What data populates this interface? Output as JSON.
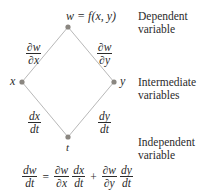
{
  "diagram": {
    "nodes": {
      "w": {
        "label": "w = f(x, y)",
        "role": "dependent"
      },
      "x": {
        "label": "x",
        "role": "intermediate"
      },
      "y": {
        "label": "y",
        "role": "intermediate"
      },
      "t": {
        "label": "t",
        "role": "independent"
      }
    },
    "edges": [
      {
        "from": "w",
        "to": "x",
        "label_num": "∂w",
        "label_den": "∂x"
      },
      {
        "from": "w",
        "to": "y",
        "label_num": "∂w",
        "label_den": "∂y"
      },
      {
        "from": "x",
        "to": "t",
        "label_num": "dx",
        "label_den": "dt"
      },
      {
        "from": "y",
        "to": "t",
        "label_num": "dy",
        "label_den": "dt"
      }
    ],
    "side_labels": {
      "dependent": [
        "Dependent",
        "variable"
      ],
      "intermediate": [
        "Intermediate",
        "variables"
      ],
      "independent": [
        "Independent",
        "variable"
      ]
    },
    "equation": {
      "lhs": {
        "num": "dw",
        "den": "dt"
      },
      "equals": "=",
      "term1": [
        {
          "num": "∂w",
          "den": "∂x"
        },
        {
          "num": "dx",
          "den": "dt"
        }
      ],
      "plus": "+",
      "term2": [
        {
          "num": "∂w",
          "den": "∂y"
        },
        {
          "num": "dy",
          "den": "dt"
        }
      ]
    },
    "colors": {
      "line": "#b8b8b8",
      "node": "#8a8680",
      "text": "#2b2b2b"
    }
  }
}
